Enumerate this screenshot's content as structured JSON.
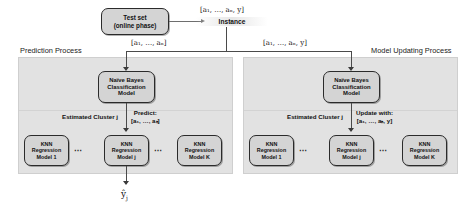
{
  "diagram": {
    "nodes": {
      "test_set": {
        "line1": "Test set",
        "line2": "(online phase)"
      },
      "instance": {
        "label": "Instance",
        "data": "[a₁, …, aₙ, y]"
      },
      "nb_left": {
        "line1": "Naïve Bayes",
        "line2": "Classification",
        "line3": "Model"
      },
      "nb_right": {
        "line1": "Naïve Bayes",
        "line2": "Classification",
        "line3": "Model"
      }
    },
    "panels": {
      "left": {
        "title": "Prediction Process",
        "cluster_label": "Estimated Cluster j",
        "action_line1": "Predict:",
        "action_line2": "[a₁, …, aₙ]",
        "models": [
          {
            "line1": "KNN",
            "line2": "Regression",
            "line3": "Model 1"
          },
          {
            "line1": "KNN",
            "line2": "Regression",
            "line3": "Model j"
          },
          {
            "line1": "KNN",
            "line2": "Regression",
            "line3": "Model K"
          }
        ],
        "ellipsis": "⋯"
      },
      "right": {
        "title": "Model Updating Process",
        "cluster_label": "Estimated Cluster j",
        "action_line1": "Update with:",
        "action_line2": "[a₁, …, aₙ, y]",
        "models": [
          {
            "line1": "KNN",
            "line2": "Regression",
            "line3": "Model 1"
          },
          {
            "line1": "KNN",
            "line2": "Regression",
            "line3": "Model j"
          },
          {
            "line1": "KNN",
            "line2": "Regression",
            "line3": "Model K"
          }
        ],
        "ellipsis": "⋯"
      }
    },
    "edge_labels": {
      "to_instance": "[a₁, …, aₙ, y]",
      "to_prediction": "[a₁, …, aₙ]",
      "to_updating": "[a₁, …, aₙ, y]"
    },
    "output": {
      "symbol": "ŷ",
      "subscript": "j"
    },
    "colors": {
      "box_fill": "#d4d4d4",
      "box_border": "#2b2b2b",
      "panel_fill": "#e2e2e2",
      "panel_border": "#cfcfcf",
      "line": "#4a4a4a",
      "text": "#111111",
      "background": "#ffffff"
    }
  }
}
